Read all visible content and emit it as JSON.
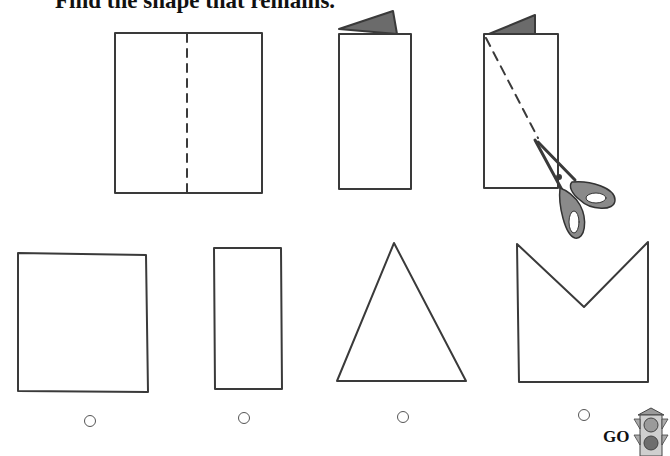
{
  "worksheet": {
    "title": "Find the shape that remains.",
    "steps": [
      {
        "name": "paper-with-fold-line",
        "description": "square paper with dashed fold line"
      },
      {
        "name": "folded-paper",
        "description": "paper folded in half"
      },
      {
        "name": "folded-paper-cut",
        "description": "folded paper cut diagonally with scissors"
      }
    ],
    "choices": [
      {
        "id": "square",
        "label": "square"
      },
      {
        "id": "rectangle",
        "label": "rectangle"
      },
      {
        "id": "triangle",
        "label": "triangle"
      },
      {
        "id": "m-shape",
        "label": "pentagon with V notch"
      }
    ],
    "go_label": "GO",
    "colors": {
      "ink": "#3a3a3a",
      "shade": "#6b6b6b"
    }
  }
}
